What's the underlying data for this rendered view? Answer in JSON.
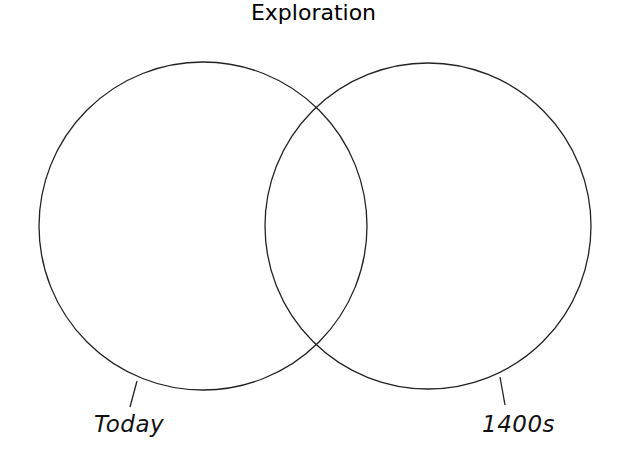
{
  "diagram": {
    "type": "venn",
    "title": "Exploration",
    "sets": [
      {
        "label": "Today",
        "items": []
      },
      {
        "label": "1400s",
        "items": []
      }
    ],
    "overlap_items": [],
    "stroke_color": "#222222",
    "background": "#ffffff"
  }
}
